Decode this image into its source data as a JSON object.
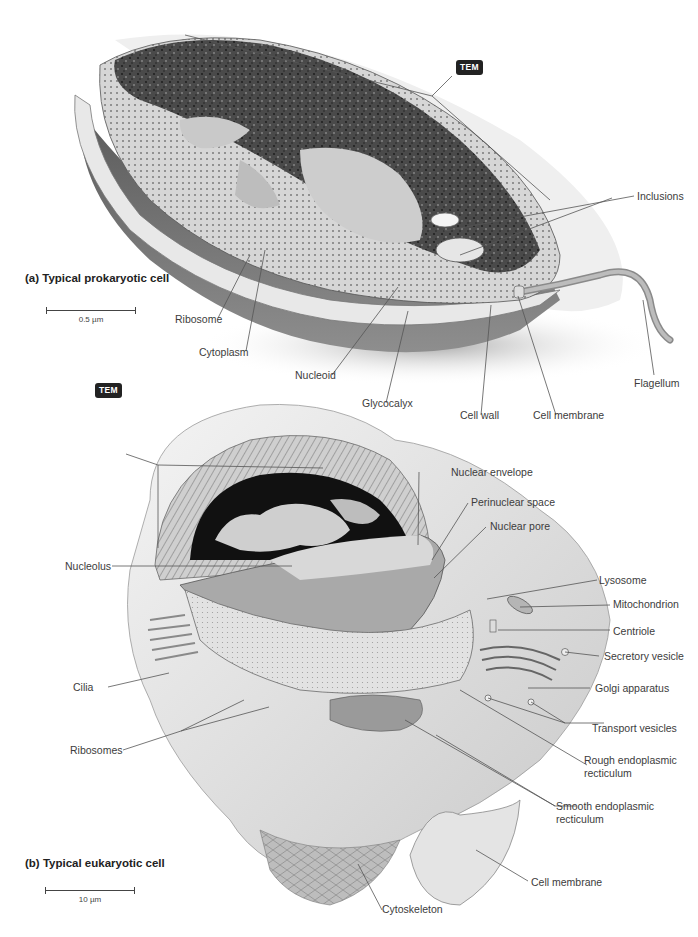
{
  "figure": {
    "panel_a": {
      "caption": "(a) Typical prokaryotic cell",
      "scale_bar": "0.5 µm",
      "badge": "TEM",
      "labels": {
        "inclusions": "Inclusions",
        "ribosome": "Ribosome",
        "cytoplasm": "Cytoplasm",
        "nucleoid": "Nucleoid",
        "glycocalyx": "Glycocalyx",
        "cell_wall": "Cell wall",
        "cell_membrane": "Cell membrane",
        "flagellum": "Flagellum"
      }
    },
    "panel_b": {
      "caption": "(b) Typical eukaryotic cell",
      "scale_bar": "10 µm",
      "badge": "TEM",
      "labels": {
        "nuclear_envelope": "Nuclear envelope",
        "perinuclear_space": "Perinuclear space",
        "nuclear_pore": "Nuclear pore",
        "nucleolus": "Nucleolus",
        "lysosome": "Lysosome",
        "mitochondrion": "Mitochondrion",
        "centriole": "Centriole",
        "secretory_vesicle": "Secretory vesicle",
        "cilia": "Cilia",
        "golgi_apparatus": "Golgi apparatus",
        "transport_vesicles": "Transport vesicles",
        "ribosomes": "Ribosomes",
        "rough_er_line1": "Rough endoplasmic",
        "rough_er_line2": "recticulum",
        "smooth_er_line1": "Smooth endoplasmic",
        "smooth_er_line2": "recticulum",
        "cell_membrane": "Cell membrane",
        "cytoskeleton": "Cytoskeleton"
      }
    }
  },
  "colors": {
    "badge_bg": "#222222",
    "label_text": "#3c3c3c",
    "leader_line": "#555555"
  }
}
